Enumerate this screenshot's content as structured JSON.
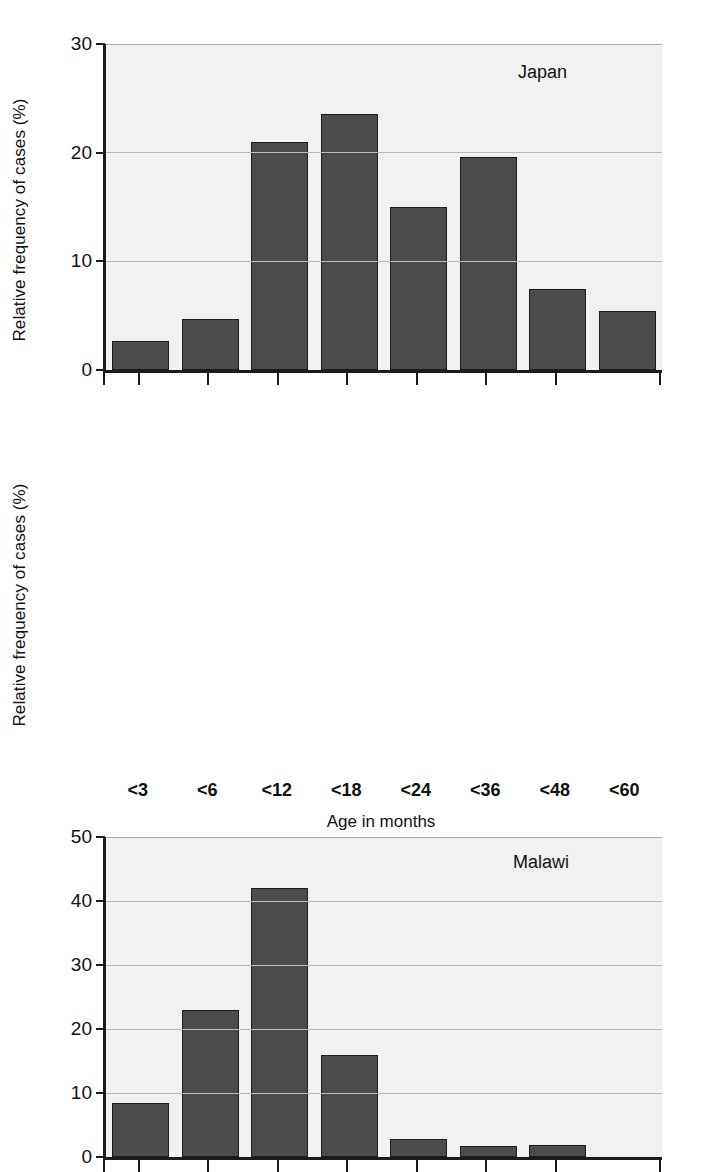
{
  "figure": {
    "xaxis_title": "Age in months",
    "yaxis_title": "Relative frequency of cases (%)",
    "bar_color": "#4c4c4c",
    "bar_edge_color": "#1d1d1d",
    "plot_background": "#f1f1f1",
    "axis_color": "#1b1b1b",
    "gridline_color": "#b9b9b9"
  },
  "categories": [
    "<3",
    "<6",
    "<12",
    "<18",
    "<24",
    "<36",
    "<48",
    "<60"
  ],
  "chart_data": [
    {
      "type": "bar",
      "title": "Japan",
      "categories": [
        "<3",
        "<6",
        "<12",
        "<18",
        "<24",
        "<36",
        "<48",
        "<60"
      ],
      "values": [
        2.7,
        4.7,
        21.0,
        23.6,
        15.0,
        19.6,
        7.5,
        5.4
      ],
      "xlabel": "Age in months",
      "ylabel": "Relative frequency of cases (%)",
      "ylim": [
        0,
        30
      ],
      "yticks": [
        0,
        10,
        20,
        30
      ],
      "ytick_labels": [
        "0",
        "10",
        "20",
        "30"
      ],
      "grid": true,
      "legend": "none"
    },
    {
      "type": "bar",
      "title": "Malawi",
      "categories": [
        "<3",
        "<6",
        "<12",
        "<18",
        "<24",
        "<36",
        "<48",
        "<60"
      ],
      "values": [
        8.5,
        23.0,
        42.0,
        16.0,
        2.8,
        1.7,
        1.9,
        0.0
      ],
      "xlabel": "Age in months",
      "ylabel": "Relative frequency of cases (%)",
      "ylim": [
        0,
        50
      ],
      "yticks": [
        0,
        10,
        20,
        30,
        40,
        50
      ],
      "ytick_labels": [
        "0",
        "10",
        "20",
        "30",
        "40",
        "50"
      ],
      "grid": true,
      "legend": "none"
    }
  ]
}
